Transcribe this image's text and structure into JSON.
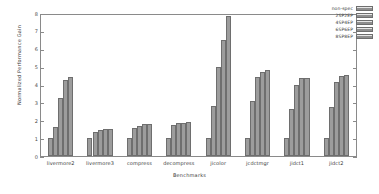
{
  "chart_data": {
    "type": "bar",
    "title": "",
    "xlabel": "Benchmarks",
    "ylabel": "Normalized Performance Gain",
    "ylim": [
      0,
      8
    ],
    "yticks": [
      0,
      1,
      2,
      3,
      4,
      5,
      6,
      7,
      8
    ],
    "grid": false,
    "legend_position": "top-right",
    "categories": [
      "livermore2",
      "livermore3",
      "compress",
      "decompress",
      "jicolor",
      "jcdctmgr",
      "jidct1",
      "jidct2"
    ],
    "series": [
      {
        "name": "non-spec",
        "values": [
          1.0,
          1.0,
          1.0,
          1.02,
          1.02,
          1.04,
          1.05,
          1.03
        ]
      },
      {
        "name": "2SP2EP",
        "values": [
          1.63,
          1.37,
          1.58,
          1.75,
          2.82,
          3.13,
          2.68,
          2.78
        ]
      },
      {
        "name": "4SP4EP",
        "values": [
          3.27,
          1.49,
          1.73,
          1.85,
          5.05,
          4.5,
          4.05,
          4.18
        ]
      },
      {
        "name": "6SP6EP",
        "values": [
          4.32,
          1.55,
          1.8,
          1.88,
          6.58,
          4.74,
          4.42,
          4.53
        ]
      },
      {
        "name": "8SP8EP",
        "values": [
          4.47,
          1.55,
          1.82,
          1.91,
          7.95,
          4.86,
          4.44,
          4.58
        ]
      }
    ]
  }
}
